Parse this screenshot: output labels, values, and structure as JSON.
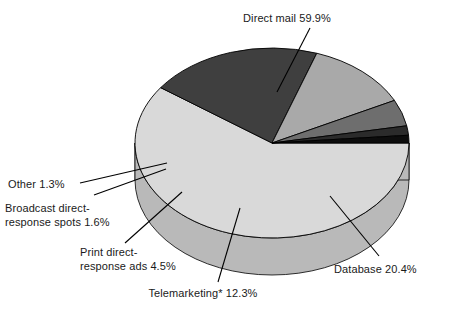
{
  "chart_data": {
    "type": "pie",
    "title": "",
    "subtitle": "",
    "xlabel": "",
    "ylabel": "",
    "legend_position": "none",
    "grid": false,
    "three_d": true,
    "units": "percent",
    "categories": [
      "Direct mail",
      "Database",
      "Telemarketing*",
      "Print direct-response ads",
      "Broadcast direct-response spots",
      "Other"
    ],
    "values": [
      59.9,
      20.4,
      12.3,
      4.5,
      1.6,
      1.3
    ],
    "slices": [
      {
        "name": "direct-mail",
        "label": "Direct mail 59.9%",
        "category": "Direct mail",
        "value": 59.9,
        "value_text": "59.9%",
        "color": "#d9d9d9",
        "side_color": "#b9b9b9"
      },
      {
        "name": "database",
        "label": "Database 20.4%",
        "category": "Database",
        "value": 20.4,
        "value_text": "20.4%",
        "color": "#3f3f3f",
        "side_color": "#323232"
      },
      {
        "name": "telemarketing",
        "label": "Telemarketing* 12.3%",
        "category": "Telemarketing*",
        "value": 12.3,
        "value_text": "12.3%",
        "color": "#a9a9a9",
        "side_color": "#8d8d8d"
      },
      {
        "name": "print-direct-response-ads",
        "label_line1": "Print direct-",
        "label_line2": "response ads 4.5%",
        "category": "Print direct-response ads",
        "value": 4.5,
        "value_text": "4.5%",
        "color": "#6e6e6e",
        "side_color": "#585858"
      },
      {
        "name": "broadcast-direct-response-spots",
        "label_line1": "Broadcast direct-",
        "label_line2": "response spots 1.6%",
        "category": "Broadcast direct-response spots",
        "value": 1.6,
        "value_text": "1.6%",
        "color": "#2b2b2b",
        "side_color": "#202020"
      },
      {
        "name": "other",
        "label": "Other 1.3%",
        "category": "Other",
        "value": 1.3,
        "value_text": "1.3%",
        "color": "#0d0d0d",
        "side_color": "#080808"
      }
    ]
  },
  "labels": {
    "direct_mail": "Direct mail 59.9%",
    "database": "Database 20.4%",
    "telemarketing": "Telemarketing* 12.3%",
    "print_line1": "Print direct-",
    "print_line2": "response ads 4.5%",
    "broadcast_line1": "Broadcast direct-",
    "broadcast_line2": "response spots 1.6%",
    "other": "Other 1.3%"
  },
  "colors": {
    "background": "#ffffff",
    "text": "#1a1a1a",
    "outline": "#000000"
  }
}
